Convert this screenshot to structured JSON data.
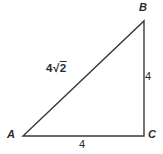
{
  "diagram": {
    "background_color": "#ffffff",
    "line_color": "#3b3b3b",
    "text_color": "#2a2a2a",
    "vertices": {
      "A": {
        "label": "A"
      },
      "B": {
        "label": "B"
      },
      "C": {
        "label": "C"
      }
    },
    "side_labels": {
      "hypotenuse_AB": {
        "text": "4√2",
        "prefix": "4√",
        "radicand": "2"
      },
      "side_BC": "4",
      "side_AC": "4"
    }
  }
}
